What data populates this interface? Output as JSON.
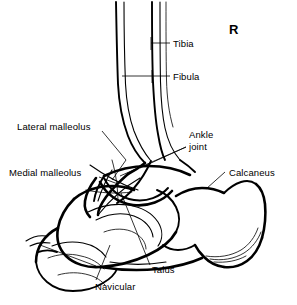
{
  "figure": {
    "type": "anatomical-line-drawing",
    "side_marker": "R",
    "background_color": "#ffffff",
    "line_color": "#000000"
  },
  "labels": {
    "tibia": "Tibia",
    "fibula": "Fibula",
    "lateral_malleolus": "Lateral malleolus",
    "medial_malleolus": "Medial malleolus",
    "ankle_joint_line1": "Ankle",
    "ankle_joint_line2": "joint",
    "calcaneus": "Calcaneus",
    "talus": "Talus",
    "navicular": "Navicular"
  }
}
